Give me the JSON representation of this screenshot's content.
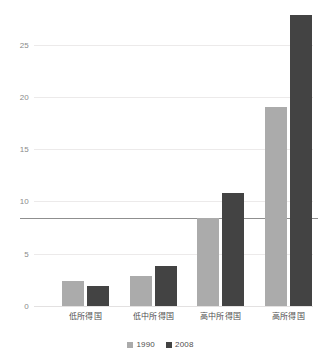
{
  "chart_data": {
    "type": "bar",
    "title": "",
    "subtitle": "",
    "xlabel": "",
    "ylabel": "",
    "categories": [
      "低所得国",
      "低中所得国",
      "高中所得国",
      "高所得国"
    ],
    "series": [
      {
        "name": "1990",
        "color": "#ababab",
        "values": [
          2.4,
          2.9,
          8.4,
          19.0
        ]
      },
      {
        "name": "2008",
        "color": "#434343",
        "values": [
          1.9,
          3.8,
          10.8,
          27.8
        ]
      }
    ],
    "ylim": [
      0,
      28.5
    ],
    "yticks": [
      0,
      5,
      10,
      15,
      20,
      25
    ],
    "ytick_labels": [
      "0",
      "5",
      "10",
      "15",
      "20",
      "25"
    ],
    "grid": true,
    "legend_position": "bottom",
    "annotations": [
      {
        "name": "reference-line",
        "type": "hline",
        "value": 8.4,
        "color": "#8f8f8f"
      }
    ]
  },
  "legend": {
    "items": [
      {
        "label": "1990",
        "color": "#ababab"
      },
      {
        "label": "2008",
        "color": "#434343"
      }
    ]
  },
  "colors": {
    "series_1990": "#ababab",
    "series_2008": "#434343",
    "gridline": "#eceaea",
    "reference_line": "#8f8f8f",
    "tick_text": "#8a8a8a",
    "label_text": "#4f4f4f",
    "background": "#ffffff"
  }
}
